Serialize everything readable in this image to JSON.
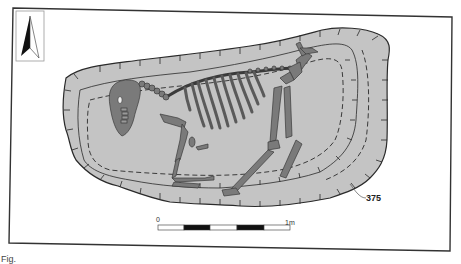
{
  "figure": {
    "type": "archaeological burial plan",
    "context_number": "375",
    "caption_fragment": "Fig."
  },
  "north_arrow": {
    "icon": "north-arrow-icon"
  },
  "scale_bar": {
    "start_label": "0",
    "end_label": "1m",
    "segments": 5,
    "segment_pattern": [
      "white",
      "black",
      "white",
      "black",
      "white"
    ]
  },
  "colors": {
    "pit_fill": "#c4c4c4",
    "bone_fill": "#7a7a7a",
    "bone_stroke": "#3a3a3a",
    "outline": "#2a2a2a",
    "frame": "#333333"
  }
}
